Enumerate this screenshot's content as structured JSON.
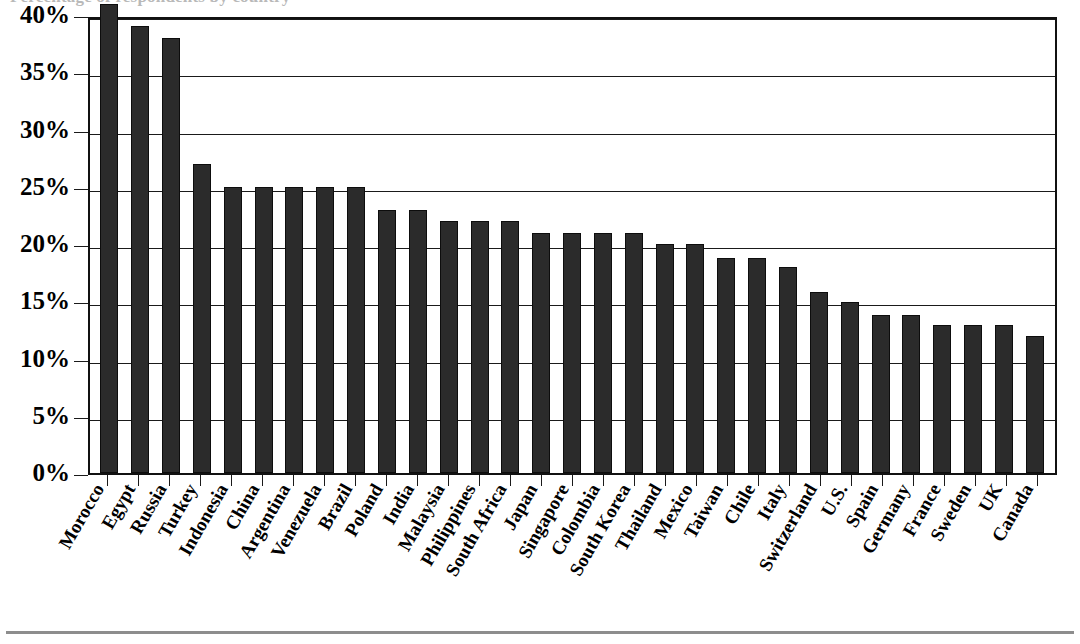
{
  "figure": {
    "clipped_title": "Percentage of respondents by country",
    "bottom_rule": true
  },
  "chart_data": {
    "type": "bar",
    "title": "",
    "subtitle": "",
    "xlabel": "",
    "ylabel": "",
    "ylim": [
      0,
      40
    ],
    "ytick_labels": [
      "40%",
      "35%",
      "30%",
      "25%",
      "20%",
      "15%",
      "10%",
      "5%",
      "0%"
    ],
    "ytick_values": [
      40,
      35,
      30,
      25,
      20,
      15,
      10,
      5,
      0
    ],
    "grid": true,
    "grid_axis": "y",
    "legend": false,
    "legend_position": "none",
    "bar_color": "#2b2b2b",
    "categories": [
      "Morocco",
      "Egypt",
      "Russia",
      "Turkey",
      "Indonesia",
      "China",
      "Argentina",
      "Venezuela",
      "Brazil",
      "Poland",
      "India",
      "Malaysia",
      "Philippines",
      "South Africa",
      "Japan",
      "Singapore",
      "Colombia",
      "South Korea",
      "Thailand",
      "Mexico",
      "Taiwan",
      "Chile",
      "Italy",
      "Switzerland",
      "U.S.",
      "Spain",
      "Germany",
      "France",
      "Sweden",
      "UK",
      "Canada"
    ],
    "values": [
      41,
      39,
      38,
      27,
      25,
      25,
      25,
      25,
      25,
      23,
      23,
      22,
      22,
      22,
      21,
      21,
      21,
      21,
      20,
      20,
      18.8,
      18.8,
      18,
      15.8,
      14.9,
      13.8,
      13.8,
      12.9,
      12.9,
      12.9,
      12
    ],
    "value_labels": [
      "41%",
      "39%",
      "38%",
      "27%",
      "25%",
      "25%",
      "25%",
      "25%",
      "25%",
      "23%",
      "23%",
      "22%",
      "22%",
      "22%",
      "21%",
      "21%",
      "21%",
      "21%",
      "20%",
      "20%",
      "18.8%",
      "18.8%",
      "18%",
      "15.8%",
      "14.9%",
      "13.8%",
      "13.8%",
      "12.9%",
      "12.9%",
      "12.9%",
      "12%"
    ]
  }
}
